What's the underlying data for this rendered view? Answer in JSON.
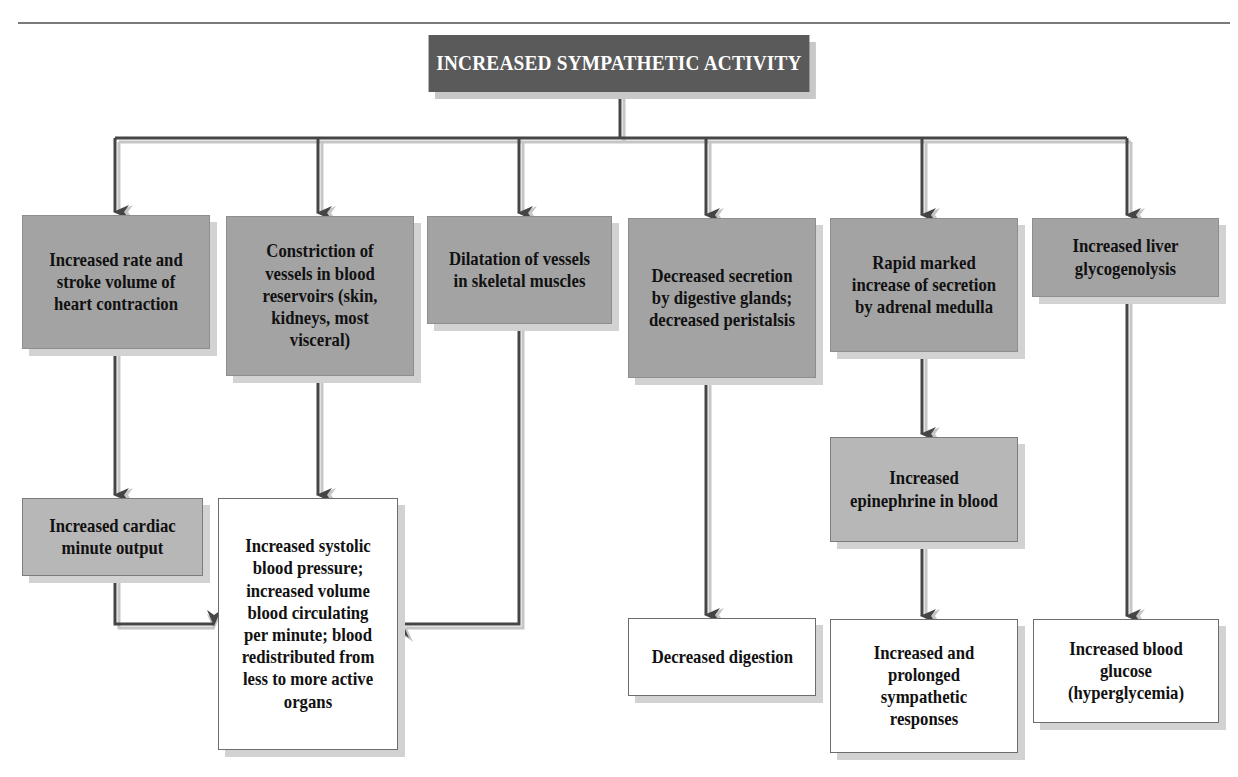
{
  "title": "INCREASED SYMPATHETIC ACTIVITY",
  "effects": [
    {
      "id": "heart",
      "label": "Increased rate and stroke volume of heart contraction"
    },
    {
      "id": "constriction",
      "label": "Constriction of vessels in blood reservoirs (skin, kidneys, most visceral)"
    },
    {
      "id": "dilatation",
      "label": "Dilatation of vessels in skeletal muscles"
    },
    {
      "id": "digestive",
      "label": "Decreased secretion by digestive glands; decreased peristalsis"
    },
    {
      "id": "adrenal",
      "label": "Rapid marked increase of secretion by adrenal medulla"
    },
    {
      "id": "liver",
      "label": "Increased liver glycogenolysis"
    }
  ],
  "intermediates": {
    "cardiac": "Increased cardiac minute output",
    "epinephrine": "Increased epinephrine in blood"
  },
  "outcomes": {
    "blood_pressure": "Increased systolic blood pressure; increased volume blood circulating per minute; blood redistributed from less to more active organs",
    "digestion": "Decreased digestion",
    "sympathetic": "Increased and prolonged sympathetic responses",
    "glucose": "Increased blood glucose (hyperglycemia)"
  },
  "colors": {
    "title_bg": "#5a5a5a",
    "box_gray": "#a3a3a3",
    "box_white": "#ffffff",
    "arrow_dark": "#444444",
    "arrow_shadow": "#c4c4c4"
  }
}
